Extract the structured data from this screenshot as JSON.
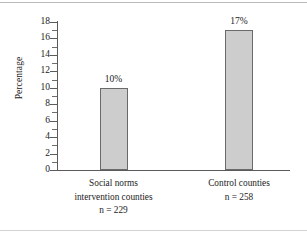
{
  "chart_data": {
    "type": "bar",
    "title": "",
    "xlabel": "",
    "ylabel": "Percentage",
    "ylim": [
      0,
      18
    ],
    "ytick_step": 2,
    "minor_ticks": true,
    "grid": false,
    "legend": "none",
    "categories": [
      "Social norms intervention counties n = 229",
      "Control counties n = 258"
    ],
    "values": [
      10,
      17
    ],
    "value_labels": [
      "10%",
      "17%"
    ],
    "ytick_labels": [
      "0",
      "2",
      "4",
      "6",
      "8",
      "10",
      "12",
      "14",
      "16",
      "18"
    ],
    "bars": [
      {
        "label_lines": [
          "Social norms",
          "intervention counties",
          "n = 229"
        ],
        "value": 10,
        "value_label": "10%",
        "n": 229
      },
      {
        "label_lines": [
          "Control counties",
          "n = 258"
        ],
        "value": 17,
        "value_label": "17%",
        "n": 258
      }
    ],
    "colors": {
      "bar_fill": "#cdcdcd",
      "bar_border": "#6a6a6a",
      "axis": "#5b5b5b",
      "text": "#1b1b1b",
      "background": "#ffffff"
    }
  }
}
